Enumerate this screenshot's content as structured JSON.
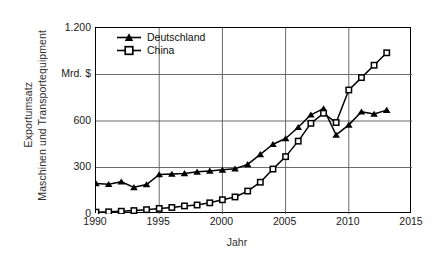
{
  "chart_data": {
    "type": "line",
    "title": "",
    "xlabel": "Jahr",
    "ylabel": "Exportumsatz Maschinen und Transportequipment",
    "ylabel_lines": [
      "Exportumsatz",
      "Maschinen und Transportequipment"
    ],
    "unit_label": "Mrd. $",
    "xlim": [
      1990,
      2015
    ],
    "ylim": [
      0,
      1200
    ],
    "xticks": [
      1990,
      1995,
      2000,
      2005,
      2010,
      2015
    ],
    "xticklabels": [
      "1990",
      "1995",
      "2000",
      "2005",
      "2010",
      "2015"
    ],
    "yticks": [
      0,
      300,
      600,
      900,
      1200
    ],
    "yticklabels": [
      "0",
      "300",
      "600",
      "Mrd. $",
      "1.200"
    ],
    "grid": true,
    "legend_position": "top-left-inside",
    "legend": [
      "Deutschland",
      "China"
    ],
    "x": [
      1990,
      1991,
      1992,
      1993,
      1994,
      1995,
      1996,
      1997,
      1998,
      1999,
      2000,
      2001,
      2002,
      2003,
      2004,
      2005,
      2006,
      2007,
      2008,
      2009,
      2010,
      2011,
      2012,
      2013
    ],
    "series": [
      {
        "name": "Deutschland",
        "marker": "filled-triangle",
        "color": "#000000",
        "values": [
          197,
          192,
          208,
          172,
          190,
          255,
          258,
          262,
          272,
          278,
          285,
          292,
          320,
          385,
          450,
          487,
          560,
          640,
          680,
          510,
          575,
          660,
          645,
          670
        ]
      },
      {
        "name": "China",
        "marker": "open-square",
        "color": "#000000",
        "values": [
          12,
          14,
          18,
          22,
          28,
          36,
          42,
          52,
          58,
          72,
          92,
          110,
          148,
          205,
          290,
          370,
          470,
          585,
          650,
          590,
          800,
          880,
          960,
          1040
        ]
      }
    ]
  }
}
